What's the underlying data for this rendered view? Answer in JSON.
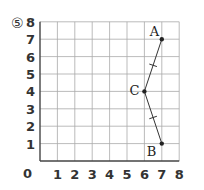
{
  "problem": {
    "label": "⑤"
  },
  "chart_data": {
    "type": "line",
    "title": "",
    "xlabel": "",
    "ylabel": "",
    "xlim": [
      0,
      8
    ],
    "ylim": [
      0,
      8
    ],
    "grid": true,
    "origin_label": "0",
    "x_ticks": [
      "1",
      "2",
      "3",
      "4",
      "5",
      "6",
      "7",
      "8"
    ],
    "y_ticks": [
      "1",
      "2",
      "3",
      "4",
      "5",
      "6",
      "7",
      "8"
    ],
    "points": [
      {
        "name": "A",
        "x": 7,
        "y": 7
      },
      {
        "name": "C",
        "x": 6,
        "y": 4
      },
      {
        "name": "B",
        "x": 7,
        "y": 1
      }
    ],
    "segments": [
      {
        "from": "A",
        "to": "C",
        "tick_marks": 1
      },
      {
        "from": "C",
        "to": "B",
        "tick_marks": 1
      }
    ]
  }
}
